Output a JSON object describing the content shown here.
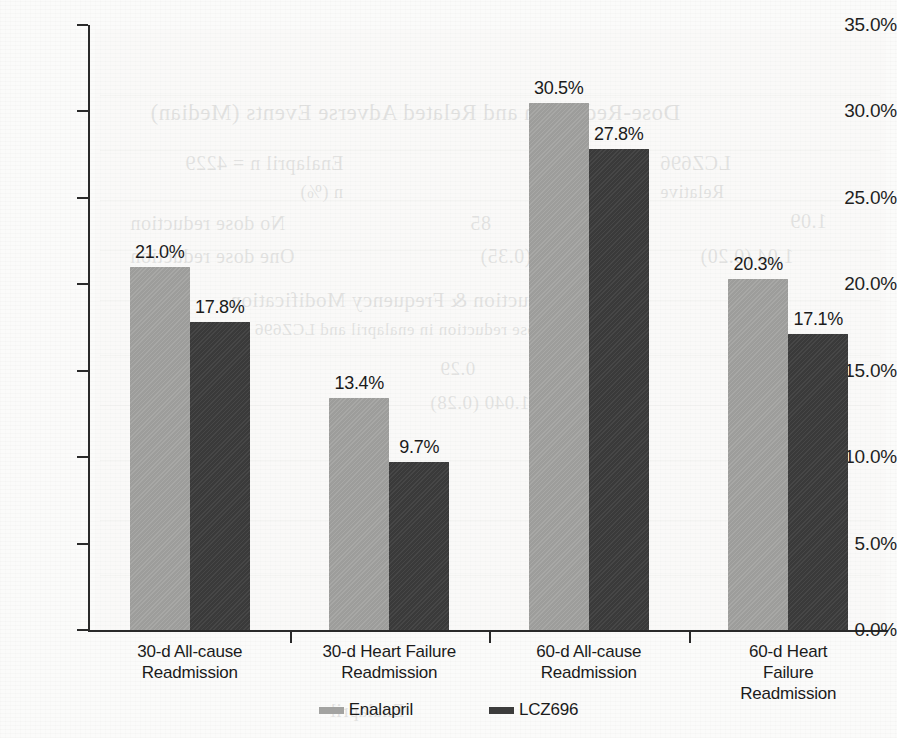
{
  "chart_data": {
    "type": "bar",
    "title": "",
    "subtitle": "",
    "xlabel": "",
    "ylabel": "",
    "ylim": [
      0,
      35
    ],
    "ytick_values": [
      0,
      5,
      10,
      15,
      20,
      25,
      30,
      35
    ],
    "ytick_labels": [
      "0.0%",
      "5.0%",
      "10.0%",
      "15.0%",
      "20.0%",
      "25.0%",
      "30.0%",
      "35.0%"
    ],
    "grid": false,
    "legend_position": "bottom",
    "value_label_suffix": "%",
    "categories": [
      "30-d All-cause Readmission",
      "30-d Heart Failure Readmission",
      "60-d All-cause Readmission",
      "60-d Heart Failure Readmission"
    ],
    "category_lines": [
      [
        "30-d All-cause",
        "Readmission"
      ],
      [
        "30-d Heart Failure",
        "Readmission"
      ],
      [
        "60-d All-cause",
        "Readmission"
      ],
      [
        "60-d Heart Failure",
        "Readmission"
      ]
    ],
    "series": [
      {
        "name": "Enalapril",
        "color": "#a3a3a1",
        "values": [
          21.0,
          13.4,
          30.5,
          20.3
        ],
        "value_labels": [
          "21.0%",
          "13.4%",
          "30.5%",
          "20.3%"
        ]
      },
      {
        "name": "LCZ696",
        "color": "#3c3c3c",
        "values": [
          17.8,
          9.7,
          27.8,
          17.1
        ],
        "value_labels": [
          "17.8%",
          "9.7%",
          "27.8%",
          "17.1%"
        ]
      }
    ]
  },
  "legend": {
    "items": [
      {
        "label": "Enalapril",
        "swatch": "series-a"
      },
      {
        "label": "LCZ696",
        "swatch": "series-b"
      }
    ]
  },
  "background_bleed": {
    "note": "faint mirrored show-through text from reverse side of the scanned page",
    "lines": [
      "Dose-Reduction and Related Adverse Events (Median)",
      "Enalapril n = 4229",
      "LCZ696",
      "n (%)",
      "n (%)",
      "Relative",
      "No dose reduction",
      "85",
      "1,230",
      "1.09",
      "One dose reduction",
      "540",
      "15 (0.35)",
      "1.04 (0.20)",
      "Dose Reduction & Frequency Modification",
      "Dose reduction in enalapril and LCZ696 arm (%)",
      "0.29",
      "0.28",
      "1.040 (0.28)",
      "Enalapril",
      "Readmission"
    ]
  }
}
